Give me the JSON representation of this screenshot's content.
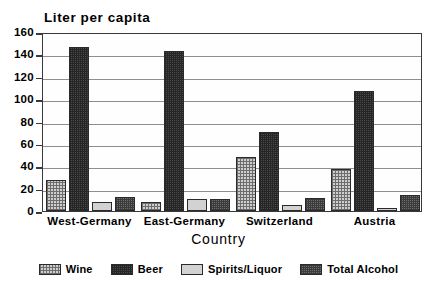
{
  "chart_data": {
    "type": "bar",
    "title": "",
    "ylabel": "Liter per capita",
    "xlabel": "Country",
    "categories": [
      "West-Germany",
      "East-Germany",
      "Switzerland",
      "Austria"
    ],
    "series": [
      {
        "name": "Wine",
        "values": [
          28,
          8.5,
          48,
          38
        ],
        "pattern": "fine-crosshatch",
        "color": "#cfcfcf"
      },
      {
        "name": "Beer",
        "values": [
          147,
          143,
          71,
          107.5
        ],
        "pattern": "dark-stipple",
        "color": "#4a4a4a"
      },
      {
        "name": "Spirits/Liquor",
        "values": [
          8,
          11,
          5.5,
          2.5
        ],
        "pattern": "solid-light",
        "color": "#d2d2d2"
      },
      {
        "name": "Total Alcohol",
        "values": [
          12.5,
          11,
          11.5,
          14.5
        ],
        "pattern": "medium-checker",
        "color": "#6e6e6e"
      }
    ],
    "ylim": [
      0,
      160
    ],
    "yticks": [
      0,
      20,
      40,
      60,
      80,
      100,
      120,
      140,
      160
    ],
    "ytick_labels": [
      "0",
      "20",
      "40",
      "60",
      "80",
      "100",
      "120",
      "140",
      "160"
    ],
    "grid": true,
    "legend_position": "bottom"
  }
}
